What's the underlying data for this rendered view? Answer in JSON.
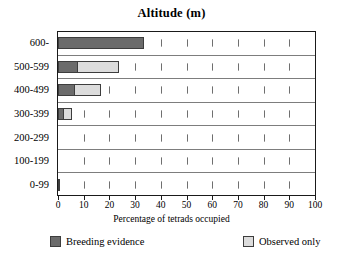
{
  "chart_data": {
    "type": "bar",
    "orientation": "horizontal",
    "stacked": true,
    "title": "Altitude (m)",
    "xlabel": "Percentage of tetrads occupied",
    "ylabel": "",
    "categories": [
      "600-",
      "500-599",
      "400-499",
      "300-399",
      "200-299",
      "100-199",
      "0-99"
    ],
    "series": [
      {
        "name": "Breeding evidence",
        "color": "#6b6b6b",
        "values": [
          33.4,
          7.7,
          6.6,
          2.3,
          0,
          0,
          0.7
        ]
      },
      {
        "name": "Observed only",
        "color": "#dcdcdc",
        "values": [
          0,
          15.9,
          10.0,
          3.1,
          0,
          0,
          0
        ]
      }
    ],
    "xlim": [
      0,
      100
    ],
    "xticks": [
      0,
      10,
      20,
      30,
      40,
      50,
      60,
      70,
      80,
      90,
      100
    ],
    "xtick_labels": [
      "0",
      "10",
      "20",
      "30",
      "40",
      "50",
      "60",
      "70",
      "80",
      "90",
      "100"
    ],
    "grid": "dotted-vertical-ticks",
    "legend_position": "bottom"
  },
  "legend": {
    "items": [
      {
        "label": "Breeding evidence",
        "swatch": "dark-gray-swatch"
      },
      {
        "label": "Observed only",
        "swatch": "light-gray-swatch"
      }
    ]
  }
}
